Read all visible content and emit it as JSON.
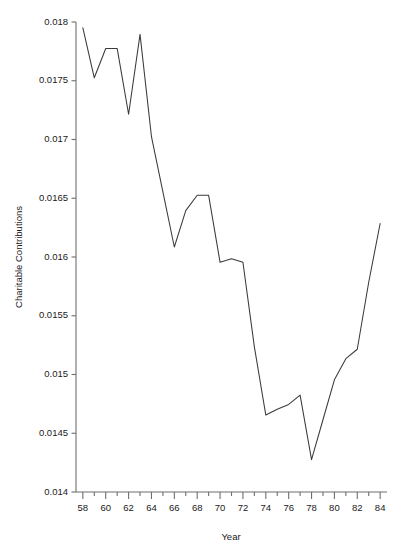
{
  "chart_data": {
    "type": "line",
    "title": "",
    "subtitle": "",
    "xlabel": "Year",
    "ylabel": "Charitable Contributions",
    "xlim": [
      57.4,
      84.6
    ],
    "ylim": [
      0.014,
      0.018
    ],
    "grid": false,
    "legend": null,
    "line_color": "#3a3a3a",
    "axis_color": "#6e6e6e",
    "x_major_tick_labels": [
      "58",
      "60",
      "62",
      "64",
      "66",
      "68",
      "70",
      "72",
      "74",
      "76",
      "78",
      "80",
      "82",
      "84"
    ],
    "x_major_tick_values": [
      58,
      60,
      62,
      64,
      66,
      68,
      70,
      72,
      74,
      76,
      78,
      80,
      82,
      84
    ],
    "x_minor_tick_values": [
      59,
      61,
      63,
      65,
      67,
      69,
      71,
      73,
      75,
      77,
      79,
      81,
      83
    ],
    "y_tick_labels": [
      "0.014",
      "0.0145",
      "0.015",
      "0.0155",
      "0.016",
      "0.0165",
      "0.017",
      "0.0175",
      "0.018"
    ],
    "y_tick_values": [
      0.014,
      0.0145,
      0.015,
      0.0155,
      0.016,
      0.0165,
      0.017,
      0.0175,
      0.018
    ],
    "x": [
      58,
      59,
      60,
      61,
      62,
      63,
      64,
      65,
      66,
      67,
      68,
      69,
      70,
      71,
      72,
      73,
      74,
      75,
      76,
      77,
      78,
      79,
      80,
      81,
      82,
      83,
      84
    ],
    "values": [
      0.01795,
      0.017525,
      0.017775,
      0.017775,
      0.017215,
      0.017895,
      0.017025,
      0.016555,
      0.016085,
      0.016395,
      0.016525,
      0.016525,
      0.015955,
      0.015985,
      0.015955,
      0.015235,
      0.014655,
      0.014705,
      0.014745,
      0.014825,
      0.014275,
      0.014615,
      0.014955,
      0.015135,
      0.015215,
      0.015785,
      0.016285
    ],
    "series": [
      {
        "name": "Charitable Contributions",
        "values": [
          0.01795,
          0.017525,
          0.017775,
          0.017775,
          0.017215,
          0.017895,
          0.017025,
          0.016555,
          0.016085,
          0.016395,
          0.016525,
          0.016525,
          0.015955,
          0.015985,
          0.015955,
          0.015235,
          0.014655,
          0.014705,
          0.014745,
          0.014825,
          0.014275,
          0.014615,
          0.014955,
          0.015135,
          0.015215,
          0.015785,
          0.016285
        ]
      }
    ]
  }
}
